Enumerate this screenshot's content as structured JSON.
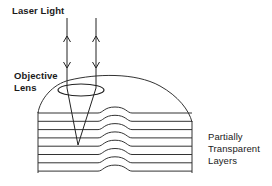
{
  "diagram": {
    "labels": {
      "laser_light": "Laser Light",
      "objective_lens": [
        "Objective",
        "Lens"
      ],
      "layers": [
        "Partially",
        "Transparent",
        "Layers"
      ]
    },
    "elements": {
      "beams": [
        {
          "name": "left-beam",
          "x": 67,
          "y_top": 18,
          "y_lens": 88,
          "arrow_up_y": 36,
          "arrow_down_y": 68
        },
        {
          "name": "right-beam",
          "x": 96,
          "y_top": 18,
          "y_lens": 88,
          "arrow_up_y": 36,
          "arrow_down_y": 68
        }
      ],
      "focal_point": {
        "x": 78,
        "y": 145
      },
      "lens": {
        "cx": 81,
        "cy": 90,
        "rx": 23,
        "ry": 6
      },
      "layer_count": 8,
      "layer_top_y": 113,
      "layer_spacing": 8.3,
      "bump": {
        "x_start": 98,
        "x_end": 132,
        "height": 6
      },
      "stack": {
        "left_x": 38,
        "right_x": 192,
        "bottom_y": 172
      }
    },
    "colors": {
      "line": "#333333",
      "text": "#1a1a1a",
      "background": "#ffffff"
    }
  }
}
